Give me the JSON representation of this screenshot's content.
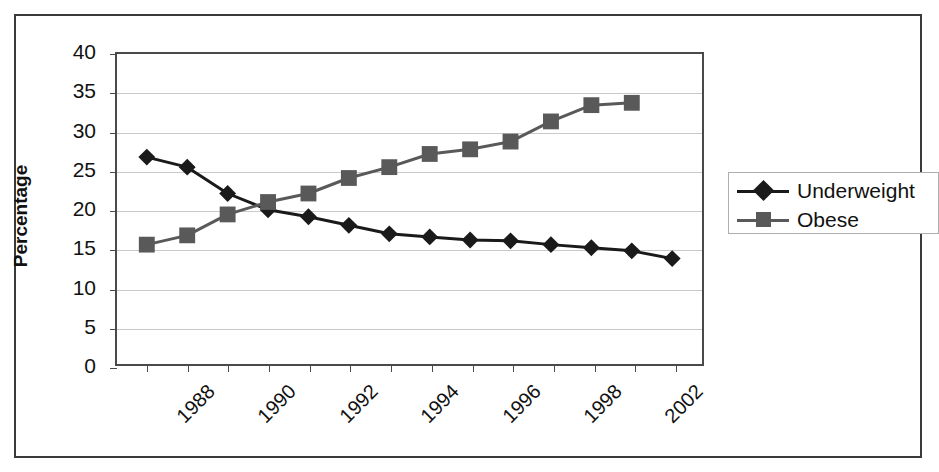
{
  "chart_data": {
    "type": "line",
    "title": "",
    "subtitle": "",
    "xlabel": "",
    "ylabel": "Percentage",
    "ylim": [
      0,
      40
    ],
    "ytick_step": 5,
    "yticks": [
      40,
      35,
      30,
      25,
      20,
      15,
      10,
      5,
      0
    ],
    "grid": true,
    "grid_axis": "y",
    "legend_position": "right",
    "x_tick_labels": [
      "1988",
      "1990",
      "1992",
      "1994",
      "1996",
      "1998",
      "2002"
    ],
    "x_tick_label_rotation": -45,
    "x_point_count": 14,
    "series": [
      {
        "name": "Underweight",
        "marker": "diamond",
        "color": "#1a1a1a",
        "values": [
          26.7,
          25.4,
          22.0,
          19.9,
          19.0,
          17.9,
          16.8,
          16.4,
          16.0,
          15.9,
          15.4,
          15.0,
          14.6,
          13.6
        ]
      },
      {
        "name": "Obese",
        "marker": "square",
        "color": "#595959",
        "values": [
          15.4,
          16.6,
          19.3,
          20.9,
          22.0,
          24.0,
          25.4,
          27.1,
          27.7,
          28.7,
          31.3,
          33.4,
          33.7
        ]
      }
    ]
  },
  "axis": {
    "y_title": "Percentage"
  },
  "legend": {
    "items": [
      {
        "label": "Underweight"
      },
      {
        "label": "Obese"
      }
    ]
  },
  "colors": {
    "underweight": "#1a1a1a",
    "obese": "#595959",
    "gridline": "#c9c9c9",
    "axis": "#4a4a4a",
    "frame": "#3a3a3a",
    "background": "#ffffff",
    "text": "#111111"
  }
}
